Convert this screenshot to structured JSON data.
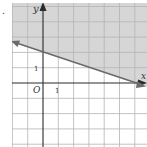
{
  "problem_marker": ".",
  "graph": {
    "type": "linear-inequality",
    "axis_labels": {
      "x": "x",
      "y": "y"
    },
    "origin_label": "O",
    "tick_labels": {
      "x": "1",
      "y": "1"
    },
    "boundary_line": {
      "slope": -0.3333,
      "y_intercept": 2,
      "x_intercept": 6,
      "style": "solid"
    },
    "shaded_region": "above",
    "x_range": [
      -2,
      6.3
    ],
    "y_range": [
      -4,
      5.2
    ],
    "colors": {
      "shade": "#d6d6d6",
      "grid": "#b0b0b0",
      "grid_light": "#d8d8d8",
      "axis": "#2a2a2a",
      "line": "#6a6a6a"
    }
  }
}
